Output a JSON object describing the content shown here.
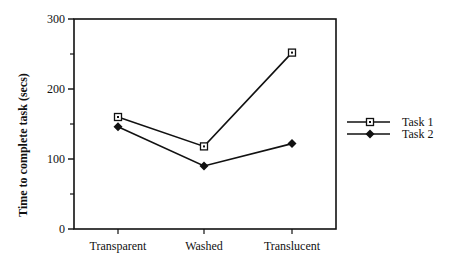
{
  "chart_data": {
    "type": "line",
    "title": "",
    "xlabel": "",
    "ylabel": "Time to complete task (secs)",
    "categories": [
      "Transparent",
      "Washed",
      "Translucent"
    ],
    "series": [
      {
        "name": "Task 1",
        "marker": "open-square",
        "values": [
          160,
          118,
          252
        ]
      },
      {
        "name": "Task 2",
        "marker": "filled-diamond",
        "values": [
          146,
          90,
          122
        ]
      }
    ],
    "ylim": [
      0,
      300
    ],
    "yticks_major": [
      0,
      100,
      200,
      300
    ],
    "yticks_minor": [
      50,
      150,
      250
    ],
    "grid": false,
    "legend_position": "right"
  },
  "colors": {
    "line": "#111111",
    "background": "#ffffff"
  }
}
